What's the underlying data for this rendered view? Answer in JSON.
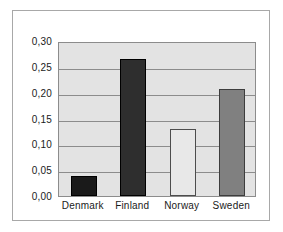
{
  "chart_data": {
    "type": "bar",
    "title": "",
    "subtitle": "",
    "xlabel": "",
    "ylabel": "",
    "categories": [
      "Denmark",
      "Finland",
      "Norway",
      "Sweden"
    ],
    "values": [
      0.038,
      0.266,
      0.13,
      0.207
    ],
    "ylim": [
      0.0,
      0.3
    ],
    "ytick_labels": [
      "0,30",
      "0,25",
      "0,20",
      "0,15",
      "0,10",
      "0,05",
      "0,00"
    ],
    "ytick_values": [
      0.3,
      0.25,
      0.2,
      0.15,
      0.1,
      0.05,
      0.0
    ],
    "decimal_separator": ",",
    "grid": true,
    "legend": "none",
    "bar_colors": [
      "#1a1a1a",
      "#2e2e2e",
      "#e8e8e8",
      "#808080"
    ],
    "bar_edge_colors": [
      "#000000",
      "#000000",
      "#4d4d4d",
      "#3d3d3d"
    ],
    "plot_background": "#e3e3e3",
    "gridline_color": "#8c8c8c",
    "frame_color": "#a8a8a8",
    "figure_background": "#ffffff",
    "series": [
      {
        "name": "value",
        "points": [
          {
            "category": "Denmark",
            "value": 0.038
          },
          {
            "category": "Finland",
            "value": 0.266
          },
          {
            "category": "Norway",
            "value": 0.13
          },
          {
            "category": "Sweden",
            "value": 0.207
          }
        ]
      }
    ]
  }
}
